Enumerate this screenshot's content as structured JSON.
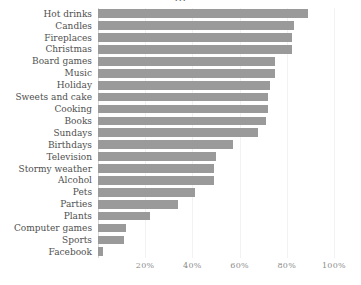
{
  "chart_data": {
    "type": "bar",
    "orientation": "horizontal",
    "title": "...",
    "xlabel": "",
    "ylabel": "",
    "xlim": [
      0,
      100
    ],
    "xticks": [
      "20%",
      "40%",
      "60%",
      "80%",
      "100%"
    ],
    "xtick_values": [
      20,
      40,
      60,
      80,
      100
    ],
    "grid": true,
    "legend": "none",
    "bar_color": "#9a9a9a",
    "categories": [
      "Hot drinks",
      "Candles",
      "Fireplaces",
      "Christmas",
      "Board games",
      "Music",
      "Holiday",
      "Sweets and cake",
      "Cooking",
      "Books",
      "Sundays",
      "Birthdays",
      "Television",
      "Stormy weather",
      "Alcohol",
      "Pets",
      "Parties",
      "Plants",
      "Computer games",
      "Sports",
      "Facebook"
    ],
    "values": [
      89,
      83,
      82,
      82,
      75,
      75,
      73,
      72,
      72,
      71,
      68,
      57,
      50,
      49,
      49,
      41,
      34,
      22,
      12,
      11,
      2
    ]
  }
}
